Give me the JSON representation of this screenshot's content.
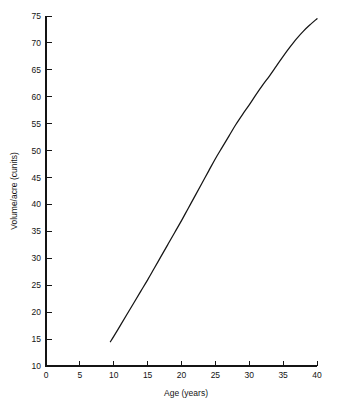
{
  "chart_data": {
    "type": "line",
    "title": "",
    "subtitle": "",
    "xlabel": "Age (years)",
    "ylabel": "Volume/acre (cunits)",
    "xlim": [
      0,
      40
    ],
    "ylim": [
      10,
      75
    ],
    "xticks": [
      0,
      5,
      10,
      15,
      20,
      25,
      30,
      35,
      40
    ],
    "xtick_labels": [
      "0",
      "5",
      "10",
      "15",
      "20",
      "25",
      "30",
      "35",
      "40"
    ],
    "yticks": [
      10,
      15,
      20,
      25,
      30,
      35,
      40,
      45,
      50,
      55,
      60,
      65,
      70,
      75
    ],
    "ytick_labels": [
      "10",
      "15",
      "20",
      "25",
      "30",
      "35",
      "40",
      "45",
      "50",
      "55",
      "60",
      "65",
      "70",
      "75"
    ],
    "grid": false,
    "legend": false,
    "legend_position": "none",
    "annotations": [],
    "series": [
      {
        "name": "Volume/acre",
        "color": "#151515",
        "x": [
          9.5,
          10,
          11,
          12,
          13,
          14,
          15,
          16,
          17,
          18,
          19,
          20,
          21,
          22,
          23,
          24,
          25,
          26,
          27,
          28,
          29,
          30,
          31,
          32,
          33,
          34,
          35,
          36,
          37,
          38,
          39,
          40
        ],
        "y": [
          14.5,
          15.5,
          17.6,
          19.7,
          21.8,
          23.9,
          26.0,
          28.2,
          30.4,
          32.6,
          34.8,
          37.0,
          39.3,
          41.6,
          43.9,
          46.2,
          48.5,
          50.6,
          52.7,
          54.8,
          56.7,
          58.5,
          60.4,
          62.2,
          63.9,
          65.7,
          67.5,
          69.2,
          70.8,
          72.2,
          73.4,
          74.5
        ]
      }
    ]
  },
  "figure": {
    "background_color": "#ffffff",
    "axis_color": "#141414"
  }
}
